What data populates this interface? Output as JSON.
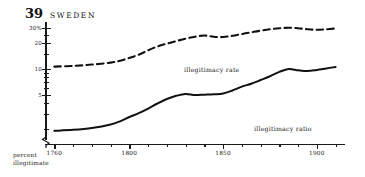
{
  "header": {
    "figure_number": "39",
    "country": "SWEDEN"
  },
  "axis_caption": {
    "line1": "percent",
    "line2": "illegitimate"
  },
  "series_labels": {
    "rate": "illegitimacy rate",
    "ratio": "illegitimacy ratio"
  },
  "chart_data": {
    "type": "line",
    "title": "39 SWEDEN",
    "subtitle": "",
    "xlabel": "",
    "ylabel": "percent illegitimate",
    "y_scale": "log",
    "ylim": [
      1.3,
      35
    ],
    "xlim": [
      1755,
      1915
    ],
    "grid": false,
    "legend": "inline-annotation",
    "y_ticks_major": [
      5,
      10,
      20,
      30
    ],
    "y_tick_labels": [
      "5",
      "10",
      "20",
      "30%"
    ],
    "y_ticks_minor": [
      2,
      3,
      4,
      6,
      7,
      8,
      9,
      15,
      25
    ],
    "x_ticks_major": [
      1760,
      1800,
      1850,
      1900
    ],
    "x_tick_labels": [
      "1760",
      "1800",
      "1850",
      "1900"
    ],
    "x_ticks_minor": [
      1770,
      1780,
      1790,
      1810,
      1820,
      1830,
      1840,
      1860,
      1870,
      1880,
      1890,
      1910
    ],
    "axis_break": true,
    "series": [
      {
        "name": "illegitimacy rate",
        "style": "dashed",
        "x": [
          1760,
          1770,
          1780,
          1790,
          1795,
          1800,
          1805,
          1810,
          1815,
          1820,
          1825,
          1830,
          1835,
          1840,
          1845,
          1850,
          1855,
          1860,
          1865,
          1870,
          1875,
          1880,
          1885,
          1890,
          1895,
          1900,
          1905,
          1910
        ],
        "values": [
          10.6,
          10.8,
          11.2,
          11.8,
          12.4,
          13.4,
          14.6,
          16.4,
          18.2,
          19.6,
          21.0,
          22.4,
          23.6,
          24.4,
          23.6,
          23.4,
          24.2,
          25.4,
          26.6,
          27.8,
          28.8,
          29.6,
          30.0,
          29.6,
          28.8,
          28.4,
          28.8,
          29.4
        ]
      },
      {
        "name": "illegitimacy ratio",
        "style": "solid",
        "x": [
          1760,
          1770,
          1780,
          1790,
          1795,
          1800,
          1805,
          1810,
          1815,
          1820,
          1825,
          1830,
          1835,
          1840,
          1845,
          1850,
          1855,
          1860,
          1865,
          1870,
          1875,
          1880,
          1885,
          1890,
          1895,
          1900,
          1905,
          1910
        ],
        "values": [
          1.9,
          1.95,
          2.05,
          2.25,
          2.45,
          2.75,
          3.05,
          3.45,
          3.95,
          4.45,
          4.85,
          5.1,
          4.95,
          5.0,
          5.05,
          5.15,
          5.6,
          6.2,
          6.7,
          7.4,
          8.2,
          9.2,
          9.95,
          9.6,
          9.4,
          9.7,
          10.1,
          10.5
        ]
      }
    ]
  }
}
